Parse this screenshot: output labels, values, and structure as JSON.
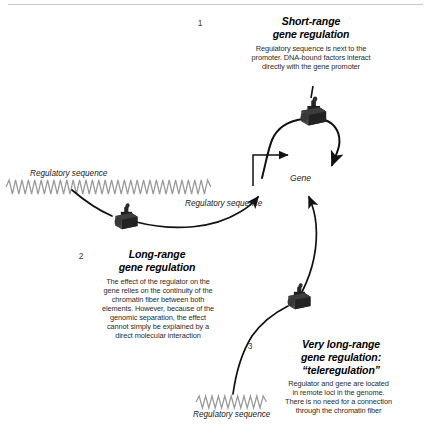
{
  "figure": {
    "title_rule": "divider-line",
    "background_color": "#ffffff",
    "ink_color": "#111111",
    "dna_color": "#8a8a8a",
    "complex_color": "#2b2b2b"
  },
  "panels": [
    {
      "number": "1",
      "title_line1": "Short-range",
      "title_line2": "gene regulation",
      "body_line1": "Regulatory sequence is next to the",
      "body_line2": "promoter. DNA-bound factors interact",
      "body_line3": "directly with the gene promoter"
    },
    {
      "number": "2",
      "title_line1": "Long-range",
      "title_line2": "gene regulation",
      "body_line1": "The effect of the regulator on the",
      "body_line2": "gene relies on the continuity of the",
      "body_line3": "chromatin fiber between both",
      "body_line4": "elements. However, because of the",
      "body_line5": "genomic separation, the effect",
      "body_line6": "cannot simply be explained by a",
      "body_line7": "direct molecular interaction"
    },
    {
      "number": "3",
      "title_line1": "Very long-range",
      "title_line2": "gene regulation:",
      "title_line3": "“teleregulation”",
      "body_line1": "Regulator and gene are located",
      "body_line2": "in remote loci in the genome.",
      "body_line3": "There is no need for a connection",
      "body_line4": "through the chromatin fiber"
    }
  ],
  "labels": {
    "regulatory_sequence_left": "Regulatory sequence",
    "regulatory_sequence_mid": "Regulatory sequence",
    "regulatory_sequence_bottom": "Regulatory sequence",
    "gene": "Gene"
  },
  "glyphs": {
    "dna_fiber": "zigzag-dna-strand",
    "protein_complex": "dna-bound-protein-complex",
    "promoter_arrow": "bent-transcription-arrow",
    "pointer_arrow": "curved-pointer-arrow"
  }
}
